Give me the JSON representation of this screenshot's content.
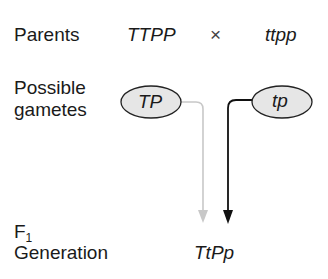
{
  "rows": {
    "parents": {
      "label": "Parents",
      "parent1": "TTPP",
      "cross_symbol": "×",
      "parent2": "ttpp"
    },
    "gametes": {
      "label_line1": "Possible",
      "label_line2": "gametes",
      "gamete1": "TP",
      "gamete2": "tp"
    },
    "f1": {
      "label_main": "F",
      "label_sub": "1",
      "label_line2": "Generation",
      "offspring": "TtPp"
    }
  },
  "colors": {
    "text": "#1a1a1a",
    "gamete1_arrow": "#c8c8c8",
    "gamete2_arrow": "#111111",
    "ellipse_fill": "#e6e6e6",
    "ellipse_stroke": "#222222"
  }
}
